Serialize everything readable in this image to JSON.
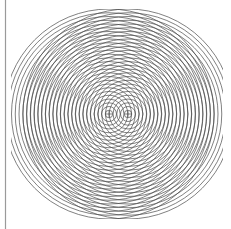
{
  "figure": {
    "title": "Two-source concentric circle interference pattern",
    "type": "geometric-diagram",
    "canvas": {
      "width": 231,
      "height": 229,
      "background_color": "#ffffff"
    },
    "stroke": {
      "color": "#4a4a4a",
      "width": 0.7
    },
    "axis_line": {
      "name": "left-vertical-rule",
      "orientation": "vertical",
      "x": 5.5,
      "y_start": 0,
      "y_end": 229,
      "color": "#9a9a9a",
      "width": 1.2
    },
    "centers": [
      {
        "label": "left-center",
        "cx": 109,
        "cy": 114,
        "marker": "plus",
        "marker_size": 3,
        "circle_count": 28,
        "radius_step": 3.75,
        "radius_min": 3.75,
        "radius_max": 105
      },
      {
        "label": "right-center",
        "cx": 128,
        "cy": 114,
        "marker": "plus",
        "marker_size": 3,
        "circle_count": 28,
        "radius_step": 3.75,
        "radius_min": 3.75,
        "radius_max": 105
      }
    ],
    "extents": {
      "left": 12,
      "right": 222,
      "top": 10,
      "bottom": 218
    }
  }
}
